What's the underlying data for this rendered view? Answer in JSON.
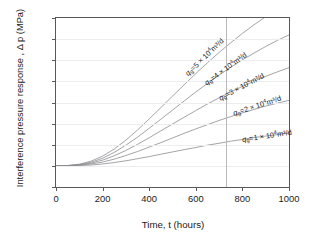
{
  "chart_data": {
    "type": "line",
    "title": "",
    "xlabel": "Time, t (hours)",
    "ylabel": "Interference pressure response , Δ p (MPa)",
    "xlim": [
      0,
      1000
    ],
    "ylim": [
      -0.01,
      0.07
    ],
    "xticks": [
      0,
      200,
      400,
      600,
      800,
      1000
    ],
    "yticks": [
      -0.01,
      0,
      0.01,
      0.02,
      0.03,
      0.04,
      0.05,
      0.06,
      0.07
    ],
    "xtick_labels": [
      "0",
      "200",
      "400",
      "600",
      "800",
      "1000"
    ],
    "ytick_labels": [
      "-0.01",
      "0",
      "0.01",
      "0.02",
      "0.03",
      "0.04",
      "0.05",
      "0.06",
      "0.07"
    ],
    "grid": "horizontal-faint",
    "legend": "inline-curve-labels",
    "annotations": [
      {
        "name": "vertical-reference-line",
        "x": 730,
        "style": "thin-solid-gray"
      }
    ],
    "x": [
      0,
      50,
      100,
      150,
      200,
      250,
      300,
      350,
      400,
      450,
      500,
      550,
      600,
      650,
      700,
      750,
      800,
      850,
      900,
      950,
      1000
    ],
    "series": [
      {
        "name": "qg5",
        "label_text": "q_g =5 × 10⁴m³/d",
        "label_parts": {
          "var": "q",
          "sub": "g",
          "eq": "=5 × 10",
          "sup": "4",
          "unit": "m³/d"
        },
        "flow_rate": 5,
        "values": [
          0,
          0.0002,
          0.0008,
          0.0022,
          0.0046,
          0.008,
          0.0122,
          0.017,
          0.0222,
          0.0276,
          0.033,
          0.0384,
          0.0437,
          0.0488,
          0.0537,
          0.0583,
          0.0627,
          0.0668,
          0.0706,
          0.0742,
          0.0775
        ]
      },
      {
        "name": "qg4",
        "label_text": "q_g =4 × 10⁴m³/d",
        "label_parts": {
          "var": "q",
          "sub": "g",
          "eq": "=4 × 10",
          "sup": "4",
          "unit": "m³/d"
        },
        "flow_rate": 4,
        "values": [
          0,
          0.0001,
          0.0006,
          0.0017,
          0.0036,
          0.0064,
          0.0098,
          0.0136,
          0.0178,
          0.0221,
          0.0264,
          0.0307,
          0.035,
          0.039,
          0.043,
          0.0467,
          0.0502,
          0.0534,
          0.0565,
          0.0594,
          0.062
        ]
      },
      {
        "name": "qg3",
        "label_text": "q_g =3 × 10⁴m³/d",
        "label_parts": {
          "var": "q",
          "sub": "g",
          "eq": "=3 × 10",
          "sup": "4",
          "unit": "m³/d"
        },
        "flow_rate": 3,
        "values": [
          0,
          0.0001,
          0.0005,
          0.0013,
          0.0027,
          0.0048,
          0.0073,
          0.0102,
          0.0133,
          0.0166,
          0.0198,
          0.023,
          0.0262,
          0.0293,
          0.0322,
          0.035,
          0.0376,
          0.0401,
          0.0424,
          0.0445,
          0.0465
        ]
      },
      {
        "name": "qg2",
        "label_text": "q_g =2 × 10⁴m³/d",
        "label_parts": {
          "var": "q",
          "sub": "g",
          "eq": "=2 × 10",
          "sup": "4",
          "unit": "m³/d"
        },
        "flow_rate": 2,
        "values": [
          0,
          0.0001,
          0.0003,
          0.0009,
          0.0018,
          0.0032,
          0.0049,
          0.0068,
          0.0089,
          0.011,
          0.0132,
          0.0154,
          0.0175,
          0.0195,
          0.0215,
          0.0233,
          0.0251,
          0.0267,
          0.0283,
          0.0297,
          0.031
        ]
      },
      {
        "name": "qg1",
        "label_text": "q_g =1 × 10⁴m³/d",
        "label_parts": {
          "var": "q",
          "sub": "g",
          "eq": "=1 × 10",
          "sup": "4",
          "unit": "m³/d"
        },
        "flow_rate": 1,
        "values": [
          0,
          0.0,
          0.0002,
          0.0004,
          0.0009,
          0.0016,
          0.0024,
          0.0034,
          0.0044,
          0.0055,
          0.0066,
          0.0077,
          0.0087,
          0.0098,
          0.0107,
          0.0117,
          0.0125,
          0.0134,
          0.0141,
          0.0148,
          0.0155
        ]
      }
    ]
  },
  "colors": {
    "axis": "#58585a",
    "curve": "#8d8d90",
    "grid": "#ededef",
    "text": "#1a1a1a",
    "background": "#ffffff"
  }
}
